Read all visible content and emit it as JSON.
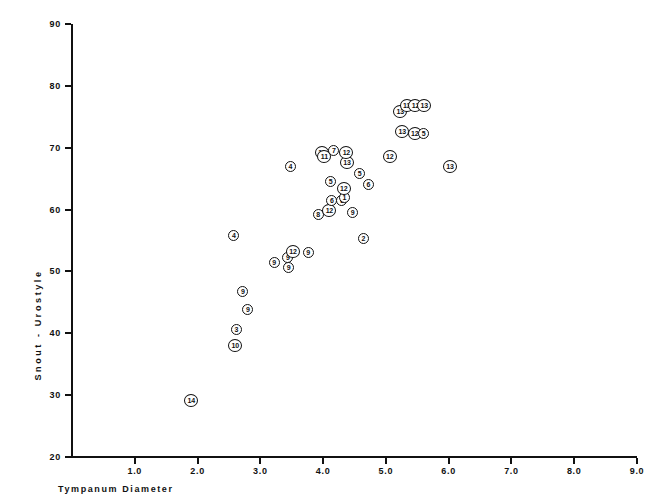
{
  "chart_data": {
    "type": "scatter",
    "title": "",
    "xlabel": "Tympanum   Diameter",
    "ylabel": "Snout - Urostyle",
    "xlim": [
      0.0,
      9.0
    ],
    "ylim": [
      20,
      90
    ],
    "grid": false,
    "legend": "none",
    "xticks": [
      "1.0",
      "2.0",
      "3.0",
      "4.0",
      "5.0",
      "6.0",
      "7.0",
      "8.0",
      "9.0"
    ],
    "xtick_values": [
      1.0,
      2.0,
      3.0,
      4.0,
      5.0,
      6.0,
      7.0,
      8.0,
      9.0
    ],
    "yticks": [
      "20",
      "30",
      "40",
      "50",
      "60",
      "70",
      "80",
      "90"
    ],
    "ytick_values": [
      20,
      30,
      40,
      50,
      60,
      70,
      80,
      90
    ],
    "marker_style": "circle-with-group-number",
    "points": [
      {
        "label": "14",
        "x": 1.9,
        "y": 29.2
      },
      {
        "label": "10",
        "x": 2.6,
        "y": 38.0
      },
      {
        "label": "3",
        "x": 2.62,
        "y": 40.6
      },
      {
        "label": "9",
        "x": 2.8,
        "y": 43.8
      },
      {
        "label": "9",
        "x": 2.72,
        "y": 46.8
      },
      {
        "label": "4",
        "x": 2.58,
        "y": 55.8
      },
      {
        "label": "9",
        "x": 3.22,
        "y": 51.4
      },
      {
        "label": "9",
        "x": 3.45,
        "y": 50.6
      },
      {
        "label": "9",
        "x": 3.44,
        "y": 52.2
      },
      {
        "label": "12",
        "x": 3.52,
        "y": 53.2
      },
      {
        "label": "9",
        "x": 3.76,
        "y": 53.0
      },
      {
        "label": "4",
        "x": 3.48,
        "y": 66.9
      },
      {
        "label": "8",
        "x": 3.92,
        "y": 59.2
      },
      {
        "label": "12",
        "x": 4.1,
        "y": 59.8
      },
      {
        "label": "9",
        "x": 4.47,
        "y": 59.6
      },
      {
        "label": "6",
        "x": 4.14,
        "y": 61.4
      },
      {
        "label": "6",
        "x": 4.3,
        "y": 61.4
      },
      {
        "label": "1",
        "x": 4.34,
        "y": 62.0
      },
      {
        "label": "12",
        "x": 4.33,
        "y": 63.4
      },
      {
        "label": "5",
        "x": 4.12,
        "y": 64.6
      },
      {
        "label": "6",
        "x": 4.72,
        "y": 64.1
      },
      {
        "label": "5",
        "x": 4.58,
        "y": 65.8
      },
      {
        "label": "13",
        "x": 4.38,
        "y": 67.6
      },
      {
        "label": "12",
        "x": 4.37,
        "y": 69.3
      },
      {
        "label": "7",
        "x": 4.17,
        "y": 69.5
      },
      {
        "label": "11",
        "x": 3.98,
        "y": 69.2
      },
      {
        "label": "11",
        "x": 4.02,
        "y": 68.6
      },
      {
        "label": "12",
        "x": 5.06,
        "y": 68.6
      },
      {
        "label": "13",
        "x": 5.26,
        "y": 72.6
      },
      {
        "label": "12",
        "x": 5.46,
        "y": 72.3
      },
      {
        "label": "5",
        "x": 5.6,
        "y": 72.3
      },
      {
        "label": "13",
        "x": 5.23,
        "y": 75.8
      },
      {
        "label": "13",
        "x": 5.33,
        "y": 76.8
      },
      {
        "label": "12",
        "x": 5.47,
        "y": 76.8
      },
      {
        "label": "13",
        "x": 5.61,
        "y": 76.9
      },
      {
        "label": "13",
        "x": 6.02,
        "y": 67.0
      },
      {
        "label": "2",
        "x": 4.64,
        "y": 55.4
      }
    ]
  }
}
